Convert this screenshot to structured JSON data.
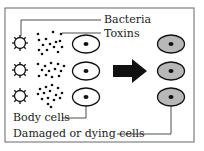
{
  "diagram": {
    "labels": {
      "bacteria": "Bacteria",
      "toxins": "Toxins",
      "body_cells": "Body cells",
      "damaged_cells": "Damaged or dying cells"
    },
    "colors": {
      "border": "#555555",
      "line": "#222222",
      "body_cell_fill": "#ffffff",
      "damaged_cell_fill": "#b8b8b8",
      "nucleus": "#111111",
      "arrow": "#111111"
    },
    "rows": 3,
    "arrow_direction": "right"
  }
}
